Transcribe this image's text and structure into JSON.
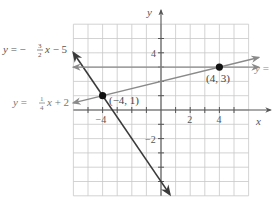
{
  "chart_data": {
    "type": "line",
    "title": "",
    "xlabel": "x",
    "ylabel": "y",
    "xlim": [
      -6,
      6
    ],
    "ylim": [
      -6,
      6
    ],
    "grid": true,
    "x_ticks": [
      {
        "value": -4,
        "label": "−4"
      },
      {
        "value": 2,
        "label": "2"
      },
      {
        "value": 4,
        "label": "4"
      }
    ],
    "y_ticks": [
      {
        "value": 4,
        "label": "4"
      },
      {
        "value": -2,
        "label": "−2"
      }
    ],
    "series": [
      {
        "name": "y = −3/2 x − 5",
        "label_prefix": "y = −",
        "label_num": "3",
        "label_den": "2",
        "label_suffix": "x − 5",
        "slope": -1.5,
        "intercept": -5,
        "x_range": [
          -6.0,
          0.6
        ],
        "color": "#3a3a3a"
      },
      {
        "name": "y = 1/4 x + 2",
        "label_prefix": "y =",
        "label_num": "1",
        "label_den": "4",
        "label_suffix": "x + 2",
        "slope": 0.25,
        "intercept": 2,
        "x_range": [
          -6.0,
          6.0
        ],
        "color": "#8a8a8a"
      },
      {
        "name": "y = 3",
        "label_prefix": "y =",
        "slope": 0,
        "intercept": 3,
        "x_range": [
          -6.0,
          6.0
        ],
        "color": "#8a8a8a"
      }
    ],
    "points": [
      {
        "x": -4,
        "y": 1,
        "label": "(−4, 1)"
      },
      {
        "x": 4,
        "y": 3,
        "label": "(4, 3)"
      }
    ],
    "annotations": [
      "y = −3/2 x − 5",
      "y = 1/4 x + 2",
      "y ="
    ]
  },
  "colors": {
    "grid": "#c8c8c8",
    "axis": "#555555",
    "text": "#555555",
    "point": "#111111"
  }
}
